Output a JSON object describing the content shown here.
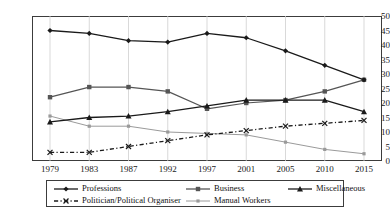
{
  "chart_data": {
    "type": "line",
    "title": "",
    "subtitle": "",
    "xlabel": "",
    "ylabel": "",
    "categories": [
      "1979",
      "1983",
      "1987",
      "1992",
      "1997",
      "2001",
      "2005",
      "2010",
      "2015"
    ],
    "ylim": [
      0,
      50
    ],
    "yticks": [
      0,
      5,
      10,
      15,
      20,
      25,
      30,
      35,
      40,
      45,
      50
    ],
    "grid": "vertical",
    "legend_position": "bottom",
    "series": [
      {
        "name": "Professions",
        "marker": "diamond",
        "color": "#1a1a1a",
        "dash": "solid",
        "values": [
          45,
          44,
          41.5,
          41,
          44,
          42.5,
          38,
          33,
          28
        ]
      },
      {
        "name": "Business",
        "marker": "square",
        "color": "#555555",
        "dash": "solid",
        "values": [
          22,
          25.5,
          25.5,
          24,
          18,
          20,
          21,
          24,
          28
        ]
      },
      {
        "name": "Miscellaneous",
        "marker": "triangle",
        "color": "#1a1a1a",
        "dash": "solid",
        "values": [
          13.5,
          15,
          15.5,
          17,
          19,
          21,
          21,
          21,
          17
        ]
      },
      {
        "name": "Politician/Political Organiser",
        "marker": "cross",
        "color": "#1a1a1a",
        "dash": "dashdot",
        "values": [
          3,
          3,
          5,
          7,
          9,
          10.5,
          12,
          13,
          14
        ]
      },
      {
        "name": "Manual Workers",
        "marker": "small-square",
        "color": "#9a9a9a",
        "dash": "solid",
        "values": [
          15.5,
          12,
          12,
          10,
          9.5,
          9,
          6.5,
          4,
          2.5
        ]
      }
    ]
  },
  "legend": {
    "row1": [
      "Professions",
      "Business",
      "Miscellaneous"
    ],
    "row2": [
      "Politician/Political Organiser",
      "Manual Workers"
    ]
  },
  "axis": {
    "y_labels": [
      "50",
      "45",
      "40",
      "35",
      "30",
      "25",
      "20",
      "15",
      "10",
      "5",
      "0"
    ],
    "x_labels": [
      "1979",
      "1983",
      "1987",
      "1992",
      "1997",
      "2001",
      "2005",
      "2010",
      "2015"
    ]
  }
}
